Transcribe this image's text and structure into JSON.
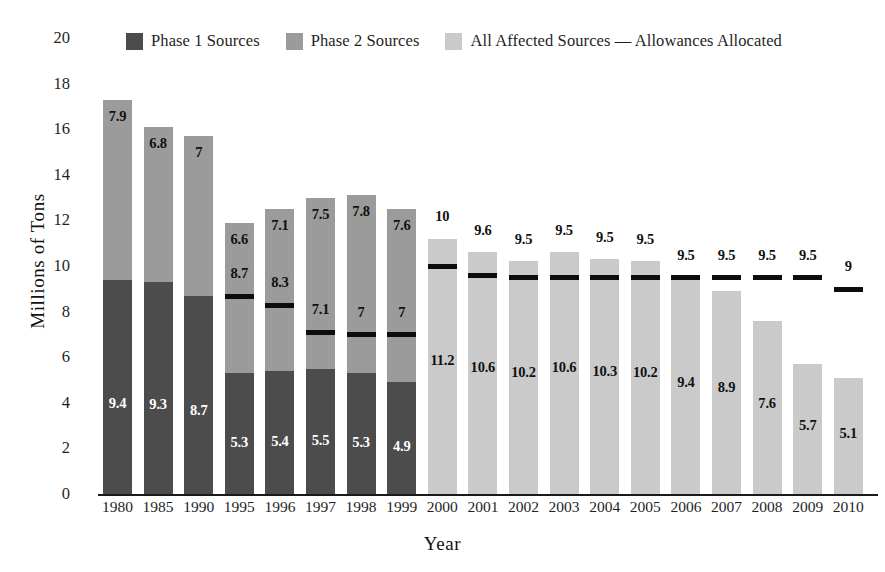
{
  "legend": {
    "items": [
      {
        "label": "Phase 1 Sources",
        "color": "#4c4c4c",
        "name": "legend-phase-1"
      },
      {
        "label": "Phase 2 Sources",
        "color": "#9b9b9b",
        "name": "legend-phase-2"
      },
      {
        "label": "All Affected Sources — Allowances Allocated",
        "color": "#cacaca",
        "name": "legend-all-affected"
      }
    ]
  },
  "axes": {
    "ylabel": "Millions of Tons",
    "xlabel": "Year",
    "yticks": [
      "0",
      "2",
      "4",
      "6",
      "8",
      "10",
      "12",
      "14",
      "16",
      "18",
      "20"
    ]
  },
  "chart_data": {
    "type": "bar",
    "title": "",
    "xlabel": "Year",
    "ylabel": "Millions of Tons",
    "ylim": [
      0,
      20
    ],
    "ytick_step": 2,
    "grid": false,
    "legend_position": "top",
    "stacked": true,
    "categories": [
      "1980",
      "1985",
      "1990",
      "1995",
      "1996",
      "1997",
      "1998",
      "1999",
      "2000",
      "2001",
      "2002",
      "2003",
      "2004",
      "2005",
      "2006",
      "2007",
      "2008",
      "2009",
      "2010"
    ],
    "series": [
      {
        "name": "Phase 1 Sources",
        "color": "#4c4c4c",
        "values": [
          9.4,
          9.3,
          8.7,
          5.3,
          5.4,
          5.5,
          5.3,
          4.9,
          null,
          null,
          null,
          null,
          null,
          null,
          null,
          null,
          null,
          null,
          null
        ]
      },
      {
        "name": "Phase 2 Sources",
        "color": "#9b9b9b",
        "values": [
          7.9,
          6.8,
          7,
          6.6,
          7.1,
          7.5,
          7.8,
          7.6,
          null,
          null,
          null,
          null,
          null,
          null,
          null,
          null,
          null,
          null,
          null
        ]
      },
      {
        "name": "All Affected Sources",
        "color": "#cacaca",
        "values": [
          null,
          null,
          null,
          null,
          null,
          null,
          null,
          null,
          11.2,
          10.6,
          10.2,
          10.6,
          10.3,
          10.2,
          9.4,
          8.9,
          7.6,
          5.7,
          5.1
        ]
      },
      {
        "name": "Allowances Allocated",
        "color": "#0d0d0d",
        "values": [
          null,
          null,
          null,
          8.7,
          8.3,
          7.1,
          7,
          7,
          10,
          9.6,
          9.5,
          9.5,
          9.5,
          9.5,
          9.5,
          9.5,
          9.5,
          9.5,
          9
        ]
      }
    ],
    "bar_labels": {
      "1980": {
        "phase1": "9.4",
        "phase2": "7.9"
      },
      "1985": {
        "phase1": "9.3",
        "phase2": "6.8"
      },
      "1990": {
        "phase1": "8.7",
        "phase2": "7"
      },
      "1995": {
        "phase1": "5.3",
        "phase2": "6.6",
        "allowance": "8.7"
      },
      "1996": {
        "phase1": "5.4",
        "phase2": "7.1",
        "allowance": "8.3"
      },
      "1997": {
        "phase1": "5.5",
        "phase2": "7.5",
        "allowance": "7.1"
      },
      "1998": {
        "phase1": "5.3",
        "phase2": "7.8",
        "allowance": "7"
      },
      "1999": {
        "phase1": "4.9",
        "phase2": "7.6",
        "allowance": "7"
      },
      "2000": {
        "all": "11.2",
        "allowance": "10"
      },
      "2001": {
        "all": "10.6",
        "allowance": "9.6"
      },
      "2002": {
        "all": "10.2",
        "allowance": "9.5"
      },
      "2003": {
        "all": "10.6",
        "allowance": "9.5"
      },
      "2004": {
        "all": "10.3",
        "allowance": "9.5"
      },
      "2005": {
        "all": "10.2",
        "allowance": "9.5"
      },
      "2006": {
        "all": "9.4",
        "allowance": "9.5"
      },
      "2007": {
        "all": "8.9",
        "allowance": "9.5"
      },
      "2008": {
        "all": "7.6",
        "allowance": "9.5"
      },
      "2009": {
        "all": "5.7",
        "allowance": "9.5"
      },
      "2010": {
        "all": "5.1",
        "allowance": "9"
      }
    }
  }
}
